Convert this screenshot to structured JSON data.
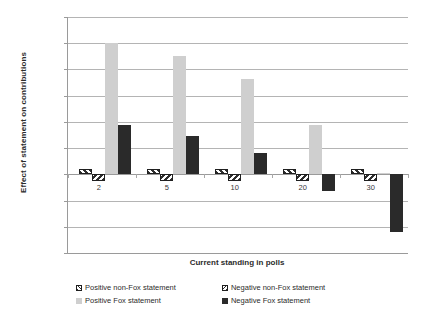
{
  "chart_data": {
    "type": "bar",
    "title": "",
    "xlabel": "Current standing in polls",
    "ylabel": "Effect of statement on contributions",
    "categories": [
      "2",
      "5",
      "10",
      "20",
      "30"
    ],
    "ylim": [
      -3000,
      6000
    ],
    "ytick_values": [
      6000,
      5000,
      4000,
      3000,
      2000,
      1000,
      0,
      -1000,
      -2000,
      -3000
    ],
    "ytick_labels": [
      "$6,000",
      "$5,000",
      "$4,000",
      "$3,000",
      "$2,000",
      "$1,000",
      "$-",
      "$(1,000)",
      "$(2,000)",
      "$(3,000)"
    ],
    "grid": true,
    "legend_position": "bottom",
    "series": [
      {
        "name": "Positive non-Fox statement",
        "color": "#ffffff",
        "pattern": "diagonal-hatch-backward",
        "values": [
          210,
          210,
          210,
          210,
          210
        ]
      },
      {
        "name": "Negative non-Fox statement",
        "color": "#ffffff",
        "pattern": "diagonal-hatch-forward",
        "values": [
          -250,
          -250,
          -250,
          -250,
          -250
        ]
      },
      {
        "name": "Positive Fox statement",
        "color": "#cfcfcf",
        "pattern": "solid",
        "values": [
          5000,
          4500,
          3650,
          1900,
          60
        ]
      },
      {
        "name": "Negative Fox statement",
        "color": "#2a2a2a",
        "pattern": "solid",
        "values": [
          1900,
          1450,
          800,
          -650,
          -2200
        ]
      }
    ]
  },
  "legend": {
    "items": [
      {
        "label": "Positive non-Fox statement",
        "swatch": "hatch-backward-swatch"
      },
      {
        "label": "Negative non-Fox statement",
        "swatch": "hatch-forward-swatch"
      },
      {
        "label": "Positive Fox statement",
        "swatch": "light-gray-swatch"
      },
      {
        "label": "Negative Fox statement",
        "swatch": "black-swatch"
      }
    ]
  }
}
